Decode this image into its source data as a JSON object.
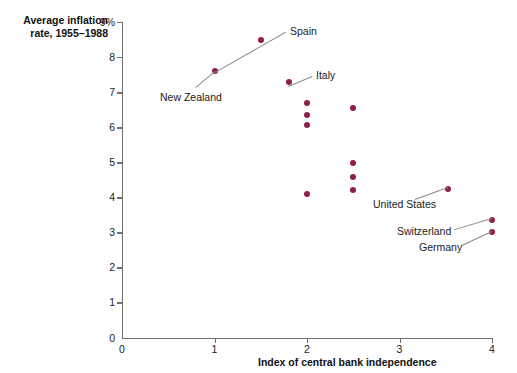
{
  "chart_data": {
    "type": "scatter",
    "title": "",
    "ylabel": "Average inflation rate, 1955–1988",
    "xlabel": "Index of central bank independence",
    "xlim": [
      0,
      4
    ],
    "ylim": [
      0,
      9
    ],
    "xticks": [
      "0",
      "1",
      "2",
      "3",
      "4"
    ],
    "yticks": [
      "0",
      "1",
      "2",
      "3",
      "4",
      "5",
      "6",
      "7",
      "8",
      "9%"
    ],
    "grid": false,
    "legend": "none",
    "point_color": "#8e1f48",
    "points": [
      {
        "x": 1.0,
        "y": 7.6,
        "label": "New Zealand"
      },
      {
        "x": 1.5,
        "y": 8.5,
        "label": "Spain"
      },
      {
        "x": 1.8,
        "y": 7.3,
        "label": "Italy"
      },
      {
        "x": 2.0,
        "y": 6.7,
        "label": ""
      },
      {
        "x": 2.0,
        "y": 6.35,
        "label": ""
      },
      {
        "x": 2.0,
        "y": 6.05,
        "label": ""
      },
      {
        "x": 2.0,
        "y": 4.1,
        "label": ""
      },
      {
        "x": 2.5,
        "y": 6.55,
        "label": ""
      },
      {
        "x": 2.5,
        "y": 4.98,
        "label": ""
      },
      {
        "x": 2.5,
        "y": 4.58,
        "label": ""
      },
      {
        "x": 2.5,
        "y": 4.2,
        "label": ""
      },
      {
        "x": 3.52,
        "y": 4.25,
        "label": "United States"
      },
      {
        "x": 4.0,
        "y": 3.35,
        "label": "Switzerland"
      },
      {
        "x": 4.0,
        "y": 3.0,
        "label": "Germany"
      }
    ],
    "annotations": [
      {
        "text": "Spain",
        "x": 290,
        "y": 26
      },
      {
        "text": "Italy",
        "x": 316,
        "y": 70
      },
      {
        "text": "New Zealand",
        "x": 160,
        "y": 92
      },
      {
        "text": "United States",
        "x": 373,
        "y": 199
      },
      {
        "text": "Switzerland",
        "x": 397,
        "y": 226
      },
      {
        "text": "Germany",
        "x": 419,
        "y": 242
      }
    ]
  }
}
